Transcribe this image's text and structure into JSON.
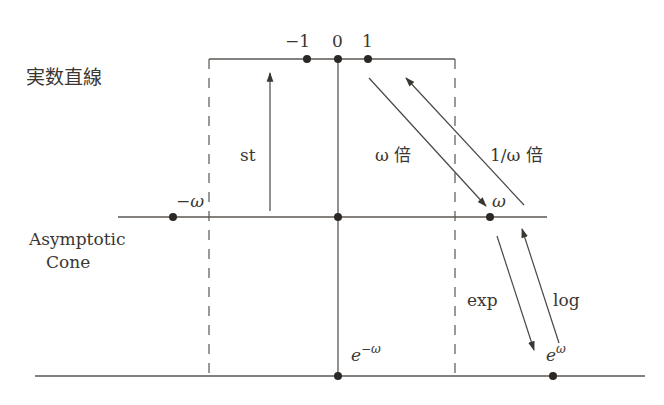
{
  "labels": {
    "real_line": "実数直線",
    "asymptotic_line1": "Asymptotic",
    "asymptotic_line2": "Cone",
    "minus_one": "−1",
    "zero": "0",
    "one": "1",
    "minus_omega": "−ω",
    "omega": "ω",
    "st": "st",
    "omega_times": "ω 倍",
    "inv_omega_times": "1/ω 倍",
    "exp": "exp",
    "log": "log",
    "e_base": "e",
    "neg_omega_exp": "−ω",
    "omega_exp": "ω"
  },
  "colors": {
    "line": "#5a5652",
    "dot": "#2c2825",
    "text": "#3a3632",
    "background": "#ffffff"
  }
}
